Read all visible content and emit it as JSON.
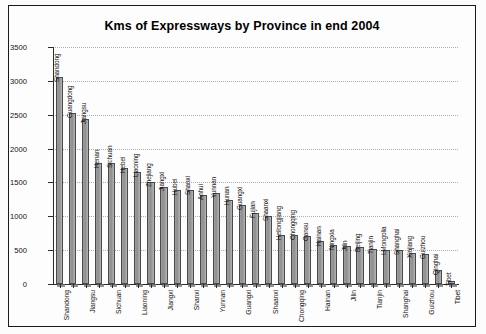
{
  "chart_data": {
    "type": "bar",
    "title": "Kms of Expressways by Province in end 2004",
    "xlabel": "",
    "ylabel": "",
    "ylim": [
      0,
      3500
    ],
    "ytick_step": 500,
    "yticks": [
      "0",
      "500",
      "1000",
      "1500",
      "2000",
      "2500",
      "3000",
      "3500"
    ],
    "grid": true,
    "legend": "none",
    "orientation": "vertical",
    "bar_label_rotation": "-90",
    "x_label_interval": 2,
    "categories": [
      "Shandong",
      "Guangdong",
      "Jiangsu",
      "Henan",
      "Sichuan",
      "Hebei",
      "Liaoning",
      "Zhejiang",
      "Jiangxi",
      "Hubei",
      "Shanxi",
      "Anhui",
      "Yunnan",
      "Hunan",
      "Guangxi",
      "Fujian",
      "Shaanxi",
      "Heilongjiang",
      "Chongqing",
      "Gansu",
      "Hainan",
      "Ningxia",
      "Jilin",
      "Beijing",
      "Tianjin",
      "I.Mongolia",
      "Shanghai",
      "Xinjiang",
      "Guizhou",
      "Qinghai",
      "Tibet"
    ],
    "values": [
      3050,
      2530,
      2440,
      1780,
      1780,
      1720,
      1650,
      1500,
      1440,
      1390,
      1390,
      1310,
      1340,
      1240,
      1170,
      1050,
      1000,
      730,
      720,
      710,
      640,
      570,
      560,
      550,
      520,
      500,
      500,
      460,
      440,
      210,
      50
    ],
    "bar_labels": [
      "Shandong",
      "Guangdong",
      "Jiangsu",
      "Henan",
      "Sichuan",
      "Hebei",
      "Liaoning",
      "Zhejiang",
      "Jiangxi",
      "Hubei",
      "Shanxi",
      "Anhui",
      "Yunnan",
      "Hunan",
      "Guangxi",
      "Fujian",
      "Shaanxi",
      "Heilongjiang",
      "Chongqing",
      "Gansu",
      "Hainan",
      "Ningxia",
      "Jilin",
      "Beijing",
      "Tianjin",
      "I.Mongolia",
      "Shanghai",
      "Xinjiang",
      "Guizhou",
      "Qinghai",
      "Tibet"
    ],
    "x_axis_labels": [
      "Shandong",
      "Jiangsu",
      "Sichuan",
      "Liaoning",
      "Jiangxi",
      "Shanxi",
      "Yunnan",
      "Guangxi",
      "Shaanxi",
      "Chongqing",
      "Hainan",
      "Jilin",
      "Tianjin",
      "Shanghai",
      "Guizhou",
      "Tibet"
    ],
    "colors": {
      "bar_fill": "#9d9d9d",
      "bar_edge": "#4a4a4a",
      "gridline": "#b0b0b0",
      "axis": "#2b2b2b",
      "text": "#111111",
      "background": "#fdfdfd"
    }
  }
}
